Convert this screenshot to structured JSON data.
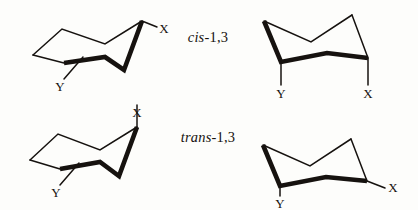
{
  "figure": {
    "background_color": "#fdfdfb",
    "ink_color": "#16120f"
  },
  "labels": {
    "cis": {
      "stereo": "cis",
      "position": "-1,3",
      "full": "cis-1,3"
    },
    "trans": {
      "stereo": "trans",
      "position": "-1,3",
      "full": "trans-1,3"
    }
  },
  "atoms": {
    "x": "X",
    "y": "Y"
  },
  "chairs": [
    {
      "id": "cis-left",
      "row": "cis",
      "column": "left",
      "substituents": [
        {
          "label": "X",
          "orientation": "equatorial",
          "direction": "up-right"
        },
        {
          "label": "Y",
          "orientation": "axial",
          "direction": "down"
        }
      ]
    },
    {
      "id": "cis-right",
      "row": "cis",
      "column": "right",
      "substituents": [
        {
          "label": "Y",
          "orientation": "axial",
          "direction": "down"
        },
        {
          "label": "X",
          "orientation": "axial",
          "direction": "down"
        }
      ]
    },
    {
      "id": "trans-left",
      "row": "trans",
      "column": "left",
      "substituents": [
        {
          "label": "X",
          "orientation": "axial",
          "direction": "up"
        },
        {
          "label": "Y",
          "orientation": "equatorial",
          "direction": "down-left"
        }
      ]
    },
    {
      "id": "trans-right",
      "row": "trans",
      "column": "right",
      "substituents": [
        {
          "label": "Y",
          "orientation": "axial",
          "direction": "down"
        },
        {
          "label": "X",
          "orientation": "equatorial",
          "direction": "down-right"
        }
      ]
    }
  ]
}
